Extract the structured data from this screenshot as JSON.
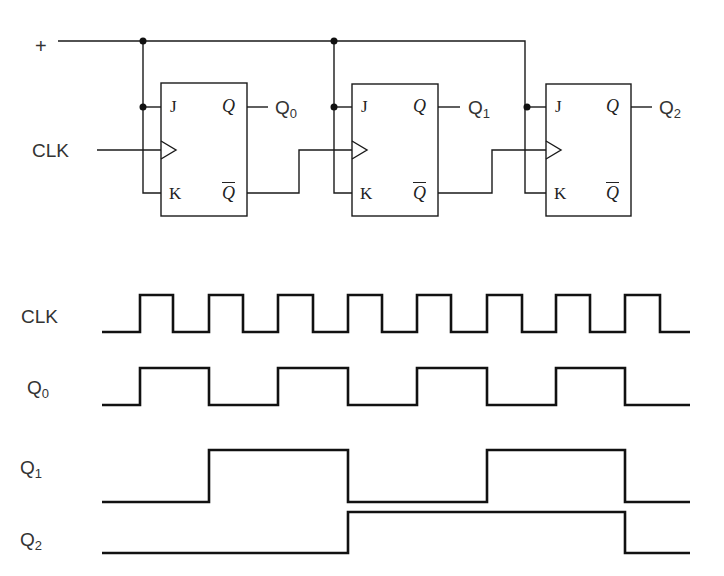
{
  "circuit": {
    "supply_label": "+",
    "clock_label": "CLK",
    "flip_flops": [
      {
        "name": "FF0",
        "pins": {
          "j": "J",
          "k": "K",
          "q": "Q",
          "qbar": "Q"
        },
        "output_label": "Q",
        "output_sub": "0"
      },
      {
        "name": "FF1",
        "pins": {
          "j": "J",
          "k": "K",
          "q": "Q",
          "qbar": "Q"
        },
        "output_label": "Q",
        "output_sub": "1"
      },
      {
        "name": "FF2",
        "pins": {
          "j": "J",
          "k": "K",
          "q": "Q",
          "qbar": "Q"
        },
        "output_label": "Q",
        "output_sub": "2"
      }
    ]
  },
  "timing": {
    "signals": [
      {
        "label": "CLK",
        "sub": "",
        "transitions": [
          140,
          173,
          209,
          243,
          278,
          313,
          348,
          382,
          417,
          451,
          487,
          522,
          556,
          590,
          625,
          660
        ]
      },
      {
        "label": "Q",
        "sub": "0",
        "transitions": [
          140,
          209,
          278,
          348,
          417,
          487,
          556,
          625
        ]
      },
      {
        "label": "Q",
        "sub": "1",
        "transitions": [
          209,
          348,
          487,
          625
        ]
      },
      {
        "label": "Q",
        "sub": "2",
        "transitions": [
          348,
          625
        ]
      }
    ],
    "x_start": 102,
    "x_end": 690
  },
  "colors": {
    "line": "#1a1a1a",
    "text": "#333333",
    "background": "#ffffff"
  }
}
